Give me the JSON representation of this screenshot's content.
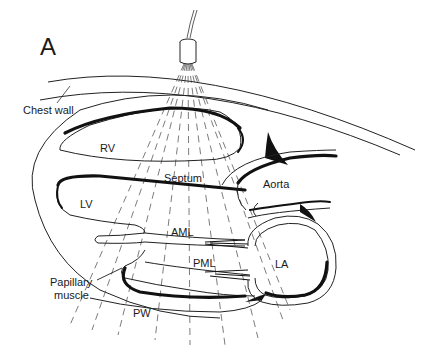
{
  "figure": {
    "panel_label": "A",
    "labels": {
      "chest_wall": "Chest wall",
      "rv": "RV",
      "septum": "Septum",
      "aorta": "Aorta",
      "lv": "LV",
      "aml": "AML",
      "pml": "PML",
      "la": "LA",
      "papillary_muscle_line1": "Papillary",
      "papillary_muscle_line2": "muscle",
      "pw": "PW"
    },
    "transducer": {
      "icon": "ultrasound-transducer-icon"
    },
    "colors": {
      "ink": "#111111",
      "background": "#ffffff"
    }
  }
}
